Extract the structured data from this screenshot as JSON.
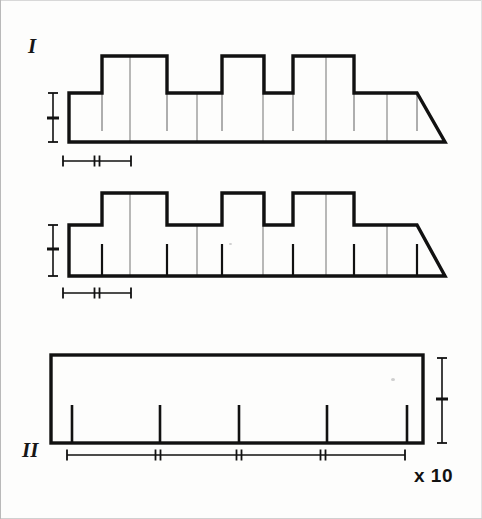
{
  "figure": {
    "caption_labels": {
      "panel_one": "I",
      "panel_two": "II",
      "magnification": "x 10"
    },
    "background_color": "#fdfdfc",
    "ink_color": "#111111",
    "guide_color": "#9a9a9a"
  },
  "chart_data": {
    "type": "line",
    "title": "",
    "subtitle": "",
    "xlabel": "",
    "ylabel": "",
    "grid": false,
    "legend": "none",
    "magnification": "x 10",
    "panels": [
      {
        "id": "profile-1",
        "group": "I",
        "type": "stepped-profile",
        "baseline_y": 142,
        "low_top_y": 93,
        "high_top_y": 56,
        "x_start": 68,
        "x_end": 444,
        "step_edges_x": [
          68,
          101,
          166,
          221,
          263,
          292,
          353,
          416,
          444
        ],
        "step_levels": [
          "low",
          "high",
          "low",
          "high",
          "low",
          "high",
          "low"
        ],
        "interior_full_lines_x": [
          129,
          196,
          262,
          325,
          386
        ],
        "hanging_tick_lines_x": [
          101,
          166,
          221,
          292,
          353,
          416
        ],
        "hanging_tick_depth": 38,
        "scale_bar_vertical": {
          "x": 52,
          "y_top": 93,
          "y_bottom": 142,
          "mid_tick_y": 118
        },
        "scale_bar_horizontal": {
          "y": 161,
          "x_start": 62,
          "x_end": 130,
          "mid_tick_x": 96
        }
      },
      {
        "id": "profile-2",
        "group": "I",
        "type": "stepped-profile",
        "baseline_y": 276,
        "low_top_y": 225,
        "high_top_y": 193,
        "x_start": 68,
        "x_end": 444,
        "step_edges_x": [
          68,
          101,
          166,
          221,
          263,
          292,
          353,
          416,
          444
        ],
        "step_levels": [
          "low",
          "high",
          "low",
          "high",
          "low",
          "high",
          "low"
        ],
        "interior_full_lines_x": [
          129,
          196,
          262,
          325,
          386
        ],
        "rising_tick_lines_x": [
          101,
          166,
          221,
          292,
          353,
          416
        ],
        "rising_tick_height": 32,
        "scale_bar_vertical": {
          "x": 52,
          "y_top": 225,
          "y_bottom": 276,
          "mid_tick_y": 249
        },
        "scale_bar_horizontal": {
          "y": 293,
          "x_start": 62,
          "x_end": 130,
          "mid_tick_x": 96
        }
      },
      {
        "id": "profile-3",
        "group": "II",
        "type": "flat-rectangle",
        "top_y": 355,
        "baseline_y": 443,
        "x_start": 50,
        "x_end": 422,
        "rising_tick_lines_x": [
          71,
          159,
          238,
          326,
          406
        ],
        "rising_tick_height": 38,
        "scale_bar_vertical": {
          "x": 441,
          "y_top": 358,
          "y_bottom": 443,
          "mid_tick_y": 399
        },
        "scale_bar_horizontal": {
          "y": 455,
          "x_start": 66,
          "x_end": 404,
          "tick_marks_x": [
            157,
            238,
            322
          ]
        }
      }
    ]
  }
}
